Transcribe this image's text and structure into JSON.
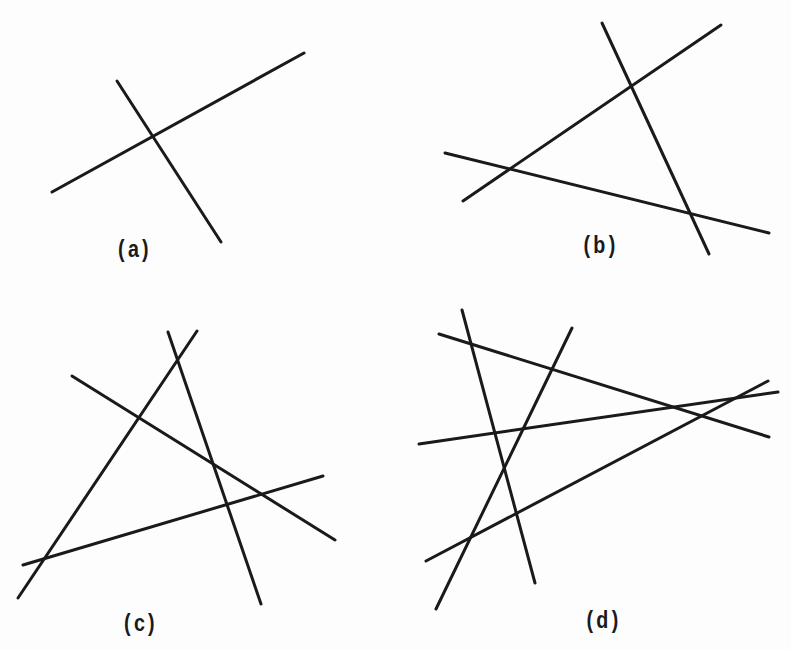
{
  "figure": {
    "stroke_color": "#1a1a1a",
    "panels": [
      {
        "id": "a",
        "label": "(a)",
        "label_pos": [
          135,
          249
        ],
        "lines": [
          [
            52,
            192,
            304,
            53
          ],
          [
            117,
            81,
            221,
            242
          ]
        ]
      },
      {
        "id": "b",
        "label": "(b)",
        "label_pos": [
          601,
          245
        ],
        "lines": [
          [
            602,
            23,
            709,
            254
          ],
          [
            721,
            25,
            463,
            201
          ],
          [
            445,
            153,
            769,
            233
          ]
        ]
      },
      {
        "id": "c",
        "label": "(c)",
        "label_pos": [
          141,
          623
        ],
        "lines": [
          [
            168,
            332,
            261,
            604
          ],
          [
            197,
            331,
            18,
            598
          ],
          [
            72,
            376,
            335,
            540
          ],
          [
            23,
            565,
            323,
            476
          ]
        ]
      },
      {
        "id": "d",
        "label": "(d)",
        "label_pos": [
          604,
          620
        ],
        "lines": [
          [
            462,
            310,
            535,
            583
          ],
          [
            572,
            328,
            436,
            609
          ],
          [
            439,
            334,
            769,
            437
          ],
          [
            419,
            444,
            778,
            392
          ],
          [
            426,
            561,
            768,
            381
          ]
        ]
      }
    ]
  }
}
